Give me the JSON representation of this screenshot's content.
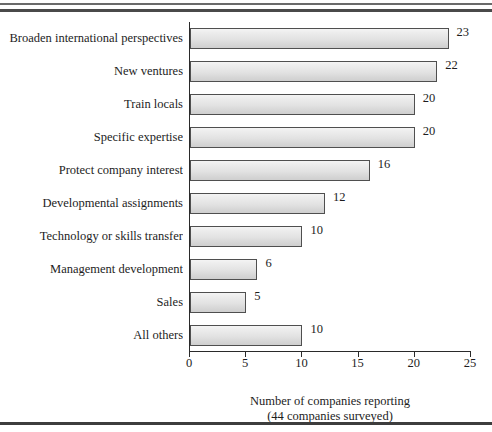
{
  "figure": {
    "background": "#ffffff",
    "rule_color": "#4a4a4a",
    "axis_color": "#2a2a2a",
    "bar_fill": "#e6e6e6",
    "bar_border": "#4f4f4f"
  },
  "caption": {
    "line1": "Number of companies reporting",
    "line2": "(44 companies surveyed)"
  },
  "chart_data": {
    "type": "bar",
    "orientation": "horizontal",
    "title": "",
    "subtitle": "",
    "xlabel": "Number of companies reporting",
    "ylabel": "",
    "annotation": "(44 companies surveyed)",
    "xlim": [
      0,
      25
    ],
    "xticks": [
      0,
      5,
      10,
      15,
      20,
      25
    ],
    "xtick_labels": [
      "0",
      "5",
      "10",
      "15",
      "20",
      "25"
    ],
    "grid": false,
    "legend": false,
    "data_labels": true,
    "categories": [
      "Broaden international perspectives",
      "New ventures",
      "Train locals",
      "Specific expertise",
      "Protect company interest",
      "Developmental assignments",
      "Technology or skills transfer",
      "Management development",
      "Sales",
      "All others"
    ],
    "values": [
      23,
      22,
      20,
      20,
      16,
      12,
      10,
      6,
      5,
      10
    ],
    "value_labels": [
      "23",
      "22",
      "20",
      "20",
      "16",
      "12",
      "10",
      "6",
      "5",
      "10"
    ]
  }
}
